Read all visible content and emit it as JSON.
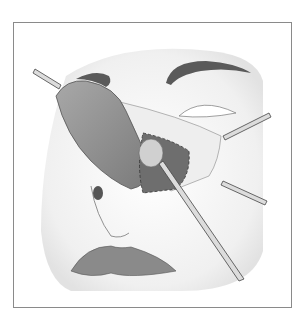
{
  "figure": {
    "type": "medical-illustration",
    "colors": {
      "frame": "#8a8a8a",
      "skin": "#f2f2f2",
      "brow": "#5a5a5a",
      "flap": "#8e8e8e",
      "cavity": "#6e6e6e",
      "lips": "#8a8a8a",
      "instrument": "#d8d8d8"
    }
  }
}
